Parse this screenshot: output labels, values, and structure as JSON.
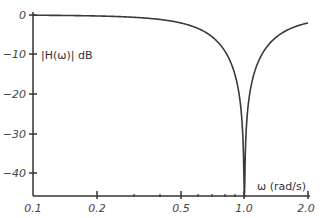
{
  "chart_data": {
    "type": "line",
    "title": "",
    "xlabel": "ω (rad/s)",
    "ylabel": "|H(ω)| dB",
    "xscale": "log",
    "xlim": [
      0.1,
      2.0
    ],
    "ylim": [
      -46,
      0
    ],
    "grid": false,
    "legend": null,
    "x_ticks": [
      0.1,
      0.2,
      0.5,
      1.0,
      2.0
    ],
    "x_tick_labels": [
      "0.1",
      "0.2",
      "0.5",
      "1.0",
      "2.0"
    ],
    "x_minor_ticks": [
      0.3,
      0.4,
      0.6,
      0.7,
      0.8,
      0.9
    ],
    "y_ticks": [
      0,
      -10,
      -20,
      -30,
      -40
    ],
    "y_tick_labels": [
      "0",
      "−10",
      "−20",
      "−30",
      "−40"
    ],
    "series": [
      {
        "name": "|H(ω)| dB",
        "x": [
          0.1,
          0.2,
          0.3,
          0.4,
          0.5,
          0.6,
          0.7,
          0.8,
          0.9,
          0.95,
          0.98,
          1.0,
          1.02,
          1.05,
          1.1,
          1.2,
          1.4,
          1.6,
          1.8,
          2.0
        ],
        "values": [
          -0.06,
          -0.25,
          -0.6,
          -1.1,
          -2.0,
          -3.1,
          -4.8,
          -7.5,
          -12.2,
          -18.0,
          -25.5,
          -46,
          -25.7,
          -18.3,
          -12.7,
          -7.6,
          -4.0,
          -2.9,
          -2.3,
          -2.0
        ]
      }
    ],
    "annotations": [
      {
        "text": "|H(ω)| dB",
        "position": "upper-left inside axes"
      },
      {
        "text": "ω (rad/s)",
        "position": "lower-right above x-axis"
      }
    ]
  },
  "labels": {
    "ylabel": "|H(ω)| dB",
    "xlabel": "ω (rad/s)",
    "y0": "0",
    "y10": "−10",
    "y20": "−20",
    "y30": "−30",
    "y40": "−40",
    "x01": "0.1",
    "x02": "0.2",
    "x05": "0.5",
    "x10": "1.0",
    "x20": "2.0"
  }
}
